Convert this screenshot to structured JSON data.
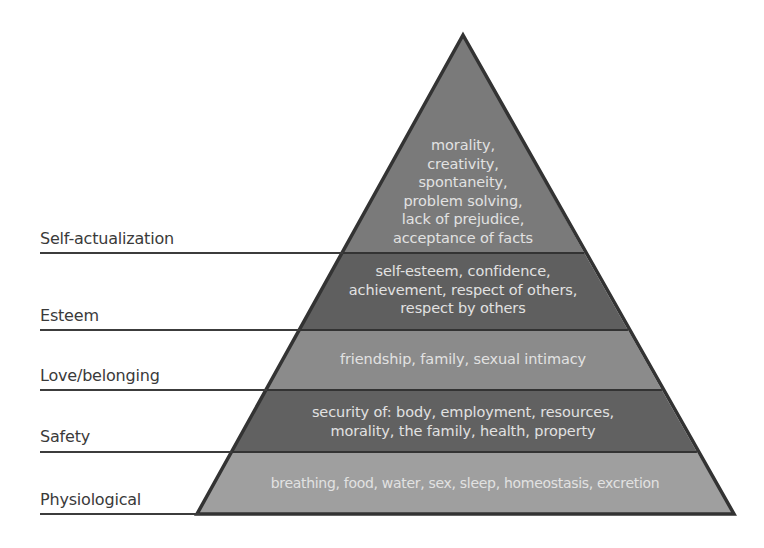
{
  "diagram": {
    "colors": {
      "self_actualization": "#7a7a7a",
      "esteem": "#5f5f5f",
      "love": "#8b8b8b",
      "safety": "#616161",
      "physiological": "#9f9f9f",
      "outline": "#333333",
      "text": "#e2e2e2",
      "label": "#3a3a3a"
    },
    "levels": [
      {
        "name": "Self-actualization",
        "lines": [
          "morality,",
          "creativity,",
          "spontaneity,",
          "problem solving,",
          "lack of prejudice,",
          "acceptance of facts"
        ]
      },
      {
        "name": "Esteem",
        "lines": [
          "self-esteem, confidence,",
          "achievement, respect of others,",
          "respect by others"
        ]
      },
      {
        "name": "Love/belonging",
        "lines": [
          "friendship, family, sexual intimacy"
        ]
      },
      {
        "name": "Safety",
        "lines": [
          "security of: body, employment, resources,",
          "morality, the family, health, property"
        ]
      },
      {
        "name": "Physiological",
        "lines": [
          "breathing, food, water, sex, sleep, homeostasis, excretion"
        ]
      }
    ]
  }
}
